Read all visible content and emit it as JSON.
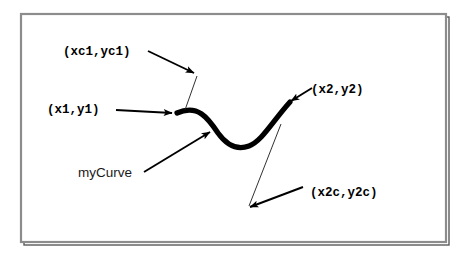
{
  "figure": {
    "kind": "bezier-curve-diagram",
    "background_color": "#ffffff",
    "frame": {
      "name": "figure-border",
      "color": "#8c8c8c",
      "shadow_color": "#4d4d4d",
      "x": 21,
      "y": 14,
      "width": 425,
      "height": 228
    },
    "curve": {
      "name": "myCurve",
      "color": "#000000",
      "stroke_width": 5,
      "start_point": {
        "x": 177,
        "y": 113
      },
      "control_point_1": {
        "x": 198,
        "y": 104
      },
      "control_point_2": {
        "x": 249,
        "y": 207
      },
      "end_point": {
        "x": 290,
        "y": 102
      }
    },
    "labels": [
      {
        "id": "xc1yc1",
        "text": "(xc1,yc1)",
        "style": "monospace-bold",
        "x": 63,
        "y": 55
      },
      {
        "id": "x1y1",
        "text": "(x1,y1)",
        "style": "monospace-bold",
        "x": 47,
        "y": 113
      },
      {
        "id": "x2y2",
        "text": "(x2,y2)",
        "style": "monospace-bold",
        "x": 311,
        "y": 93
      },
      {
        "id": "mycurve",
        "text": "myCurve",
        "style": "sans",
        "x": 78,
        "y": 177
      },
      {
        "id": "x2cy2c",
        "text": "(x2c,y2c)",
        "style": "monospace-bold",
        "x": 310,
        "y": 196
      }
    ],
    "annotations": {
      "arrow_color": "#000000",
      "leader_color": "#1a1a1a",
      "arrow_stroke_width": 1.9,
      "leader_stroke_width": 0.8
    }
  }
}
